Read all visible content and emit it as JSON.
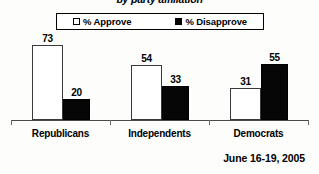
{
  "title": "by party affiliation",
  "footer_date": "June 16-19, 2005",
  "legend": {
    "approve": {
      "label": "% Approve",
      "marker": "hollow-square",
      "color": "#ffffff"
    },
    "disapprove": {
      "label": "% Disapprove",
      "marker": "filled-square",
      "color": "#000000"
    }
  },
  "categories": [
    {
      "label": "Republicans",
      "approve": 73,
      "disapprove": 20
    },
    {
      "label": "Independents",
      "approve": 54,
      "disapprove": 33
    },
    {
      "label": "Democrats",
      "approve": 31,
      "disapprove": 55
    }
  ],
  "chart_data": {
    "type": "bar",
    "title": "by party affiliation",
    "subtitle": "",
    "xlabel": "",
    "ylabel": "",
    "categories": [
      "Republicans",
      "Independents",
      "Democrats"
    ],
    "series": [
      {
        "name": "% Approve",
        "values": [
          73,
          54,
          31
        ],
        "color": "#ffffff"
      },
      {
        "name": "% Disapprove",
        "values": [
          20,
          33,
          55
        ],
        "color": "#000000"
      }
    ],
    "data_labels": [
      73,
      20,
      54,
      33,
      31,
      55
    ],
    "ylim": [
      0,
      80
    ],
    "grid": false,
    "legend_position": "top",
    "annotations": [
      "June 16-19, 2005"
    ]
  }
}
